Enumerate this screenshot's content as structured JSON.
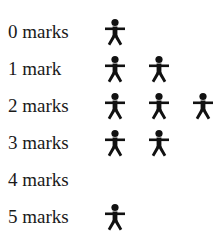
{
  "chart_data": {
    "type": "pictogram",
    "title": "",
    "xlabel": "",
    "ylabel": "",
    "icon": "person-icon",
    "categories": [
      "0 marks",
      "1 mark",
      "2 marks",
      "3 marks",
      "4 marks",
      "5 marks"
    ],
    "values": [
      1,
      2,
      3,
      2,
      0,
      1
    ]
  },
  "rows": [
    {
      "label": "0 marks",
      "count": 1
    },
    {
      "label": "1 mark",
      "count": 2
    },
    {
      "label": "2 marks",
      "count": 3
    },
    {
      "label": "3 marks",
      "count": 2
    },
    {
      "label": "4 marks",
      "count": 0
    },
    {
      "label": "5 marks",
      "count": 1
    }
  ],
  "colors": {
    "icon": "#111111",
    "text": "#1a1a1a",
    "background": "#ffffff"
  }
}
